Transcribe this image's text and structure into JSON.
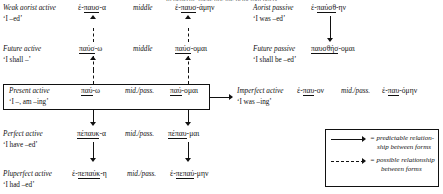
{
  "page": {
    "clipped_top_line": "In general, these are the principal parts"
  },
  "rows": {
    "weak_aorist": {
      "active_label": "Weak aorist active",
      "active_gloss": "‘I –ed’",
      "active_form_pre": "ἐ-",
      "active_form_stem": "παυσ",
      "active_form_post": "-α",
      "voice2": "middle",
      "mid_form_pre": "ἐ-",
      "mid_form_stem": "παυσ",
      "mid_form_post": "-άμην"
    },
    "aorist_passive": {
      "label": "Aorist passive",
      "gloss": "‘I was –ed’",
      "form_pre": "ἐ-",
      "form_stem": "παύσθ",
      "form_post": "-ην"
    },
    "future": {
      "active_label": "Future active",
      "active_gloss": "‘I shall –’",
      "active_form_stem": "παύσ",
      "active_form_post": "-ω",
      "voice2": "middle",
      "mid_form_stem": "παύσ",
      "mid_form_post": "-ομαι"
    },
    "future_passive": {
      "label": "Future passive",
      "gloss": "‘I shall be –ed’",
      "form_stem": "παυσθήσ",
      "form_post": "-ομαι"
    },
    "present": {
      "active_label": "Present active",
      "active_gloss": "‘I –, am –ing’",
      "active_form_stem": "παύ",
      "active_form_post": "-ω",
      "voice2": "mid./pass.",
      "mid_form_stem": "παύ",
      "mid_form_post": "-ομαι"
    },
    "imperfect": {
      "active_label": "Imperfect active",
      "gloss": "‘I was –ing’",
      "active_form_pre": "ἐ-",
      "active_form_stem": "παυ",
      "active_form_post": "-ον",
      "voice2": "mid./pass.",
      "mid_form_pre": "ἐ-",
      "mid_form_stem": "παυ",
      "mid_form_post": "-όμην"
    },
    "perfect": {
      "active_label": "Perfect active",
      "active_gloss": "‘I have –ed’",
      "active_form_stem": "πέπαυκ",
      "active_form_post": "-α",
      "voice2": "mid./pass.",
      "mid_form_stem": "πέπαυ",
      "mid_form_post": "-μαι"
    },
    "pluperfect": {
      "active_label": "Pluperfect active",
      "active_gloss": "‘I had –ed’",
      "active_form_pre": "ἐ-",
      "active_form_stem": "πεπαύκ",
      "active_form_post": "-η",
      "voice2": "mid./pass.",
      "mid_form_pre": "ἐ-",
      "mid_form_stem": "πεπαύ",
      "mid_form_post": "-μην"
    }
  },
  "legend": {
    "solid_line1": "= predictable relation-",
    "solid_line2": "ship between forms",
    "dashed_line1": "= possible relationship",
    "dashed_line2": "between forms"
  },
  "colors": {
    "ink": "#111111",
    "background": "#ffffff"
  }
}
